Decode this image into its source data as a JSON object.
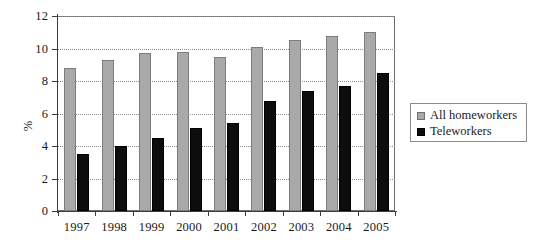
{
  "chart_data": {
    "type": "bar",
    "title": "",
    "subtitle": "",
    "xlabel": "",
    "ylabel": "%",
    "categories": [
      "1997",
      "1998",
      "1999",
      "2000",
      "2001",
      "2002",
      "2003",
      "2004",
      "2005"
    ],
    "series": [
      {
        "name": "All homeworkers",
        "color": "#a9a9a9",
        "values": [
          8.8,
          9.3,
          9.7,
          9.8,
          9.5,
          10.1,
          10.5,
          10.8,
          11.0
        ]
      },
      {
        "name": "Teleworkers",
        "color": "#0d0d0d",
        "values": [
          3.5,
          4.0,
          4.5,
          5.1,
          5.4,
          6.8,
          7.4,
          7.7,
          8.5
        ]
      }
    ],
    "ylim": [
      0,
      12
    ],
    "yticks": [
      0,
      2,
      4,
      6,
      8,
      10,
      12
    ],
    "ytick_labels": [
      "0",
      "2",
      "4",
      "6",
      "8",
      "10",
      "12"
    ],
    "grid": true,
    "grid_axis": "y",
    "legend_position": "right",
    "legend_entries": [
      "All homeworkers",
      "Teleworkers"
    ]
  },
  "legend": {
    "items": [
      {
        "label": "All homeworkers",
        "swatch": "legend-swatch-gray"
      },
      {
        "label": "Teleworkers",
        "swatch": "legend-swatch-black"
      }
    ]
  }
}
